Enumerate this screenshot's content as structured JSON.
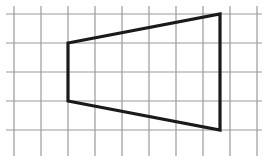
{
  "figure": {
    "background_color": "#ffffff",
    "canvas": {
      "width": 264,
      "height": 163
    },
    "grid": {
      "name": "square-grid",
      "line_color": "#9a9a9a",
      "line_width": 1.2,
      "cell_width": 27,
      "cell_height": 29,
      "x_start": 14,
      "y_start": 14,
      "columns": 9,
      "rows": 5,
      "vertical_line_x": [
        14,
        41,
        68,
        95,
        122,
        149,
        176,
        203,
        230,
        257
      ],
      "vertical_line_y_top": 6,
      "vertical_line_y_bottom": 156,
      "horizontal_line_y": [
        14,
        43,
        72,
        101,
        130
      ],
      "horizontal_line_x_left": 6,
      "horizontal_line_x_right": 262
    },
    "shape": {
      "name": "trapezoid",
      "type": "polygon",
      "stroke_color": "#1a1a1a",
      "stroke_width": 3.2,
      "fill": "none",
      "vertices": [
        {
          "label": "top-left",
          "x": 68,
          "y": 43
        },
        {
          "label": "top-right",
          "x": 220,
          "y": 14
        },
        {
          "label": "bottom-right",
          "x": 220,
          "y": 130
        },
        {
          "label": "bottom-left",
          "x": 68,
          "y": 101
        }
      ],
      "points_string": "68,43 220,14 220,130 68,101"
    }
  },
  "chart_data": {
    "type": "scatter",
    "xlabel": "",
    "ylabel": "",
    "grid": true,
    "legend": "none",
    "xlim": [
      0,
      9
    ],
    "ylim": [
      0,
      5
    ],
    "x": [
      2,
      7.63,
      7.63,
      2
    ],
    "y": [
      4,
      5,
      1,
      3
    ],
    "annotations": [
      "left vertical side spans 2 grid units",
      "right vertical side spans 4 grid units",
      "horizontal span between parallel sides is about 5.6 grid units"
    ]
  }
}
